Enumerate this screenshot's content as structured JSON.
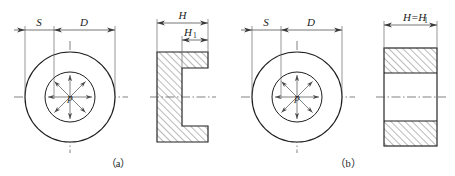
{
  "figure": {
    "title_visible": false,
    "background_color": "#ffffff",
    "line_color": "#1f1f1f",
    "dimension_color": "#3a3a3a",
    "centerline_color": "#4a4a4a",
    "hatch_color": "#2a2a2a"
  },
  "panels": [
    {
      "id": "a",
      "caption": "（a）",
      "caption_x": 118,
      "caption_y": 166,
      "front_view": {
        "center_x": 70,
        "center_y": 97,
        "outer_radius": 45,
        "inner_radius": 25,
        "pressure_label": "p",
        "arrow_count": 8,
        "arrow_direction": "inward"
      },
      "section_view": {
        "left": 157,
        "right": 208,
        "top": 52,
        "bottom": 142,
        "bore_left": 182,
        "bore_top": 68,
        "bore_bottom": 126,
        "bore_type": "blind",
        "hatched": true
      },
      "dimensions": [
        {
          "name": "S",
          "label": "S",
          "subscript": "",
          "label_x": 39,
          "label_y": 25,
          "line_y": 30,
          "x1": 25,
          "x2": 54,
          "arrow_style": "outside"
        },
        {
          "name": "D",
          "label": "D",
          "subscript": "",
          "label_x": 84,
          "label_y": 25,
          "line_y": 30,
          "x1": 54,
          "x2": 115,
          "arrow_style": "inside"
        },
        {
          "name": "H",
          "label": "H",
          "subscript": "",
          "label_x": 178,
          "label_y": 18,
          "line_y": 23,
          "x1": 157,
          "x2": 208,
          "arrow_style": "inside"
        },
        {
          "name": "H1",
          "label": "H",
          "subscript": "1",
          "label_x": 190,
          "label_y": 35,
          "line_y": 40,
          "x1": 182,
          "x2": 208,
          "arrow_style": "inside"
        }
      ]
    },
    {
      "id": "b",
      "caption": "（b）",
      "caption_x": 348,
      "caption_y": 166,
      "front_view": {
        "center_x": 297,
        "center_y": 97,
        "outer_radius": 45,
        "inner_radius": 25,
        "pressure_label": "p",
        "arrow_count": 8,
        "arrow_direction": "inward"
      },
      "section_view": {
        "left": 384,
        "right": 437,
        "top": 48,
        "bottom": 146,
        "band_top_bottom": 73,
        "band_bottom_top": 121,
        "bore_type": "through",
        "hatched": true
      },
      "dimensions": [
        {
          "name": "S",
          "label": "S",
          "subscript": "",
          "label_x": 266,
          "label_y": 25,
          "line_y": 30,
          "x1": 252,
          "x2": 281,
          "arrow_style": "outside"
        },
        {
          "name": "D",
          "label": "D",
          "subscript": "",
          "label_x": 311,
          "label_y": 25,
          "line_y": 30,
          "x1": 281,
          "x2": 342,
          "arrow_style": "inside"
        },
        {
          "name": "H=H1",
          "label": "H=H",
          "subscript": "1",
          "label_x": 395,
          "label_y": 20,
          "line_y": 25,
          "x1": 384,
          "x2": 437,
          "arrow_style": "inside"
        }
      ]
    }
  ]
}
